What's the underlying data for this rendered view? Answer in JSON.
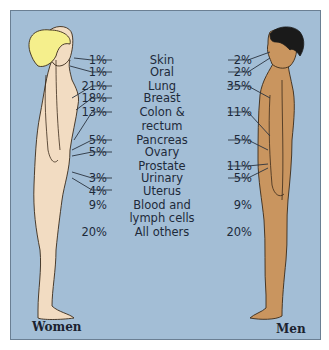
{
  "figure": {
    "left_label": "Women",
    "right_label": "Men",
    "colors": {
      "background": "#a3bed6",
      "border": "#6a7f93",
      "women_skin": "#f2dcc2",
      "women_hair": "#f5ef8c",
      "men_skin": "#c9955f",
      "men_hair": "#1a1a1a",
      "text": "#1e2a3a"
    }
  },
  "rows": [
    {
      "site": "Skin",
      "women": "1%",
      "men": "2%"
    },
    {
      "site": "Oral",
      "women": "1%",
      "men": "2%"
    },
    {
      "site": "Lung",
      "women": "21%",
      "men": "35%"
    },
    {
      "site": "Breast",
      "women": "18%",
      "men": ""
    },
    {
      "site": "Colon &",
      "women": "13%",
      "men": "11%"
    },
    {
      "site": "rectum",
      "women": "",
      "men": ""
    },
    {
      "site": "Pancreas",
      "women": "5%",
      "men": "5%"
    },
    {
      "site": "Ovary",
      "women": "5%",
      "men": ""
    },
    {
      "site": "Prostate",
      "women": "",
      "men": "11%"
    },
    {
      "site": "Urinary",
      "women": "3%",
      "men": "5%"
    },
    {
      "site": "Uterus",
      "women": "4%",
      "men": ""
    },
    {
      "site": "Blood and",
      "women": "9%",
      "men": "9%"
    },
    {
      "site": "lymph cells",
      "women": "",
      "men": ""
    },
    {
      "site": "All others",
      "women": "20%",
      "men": "20%"
    }
  ]
}
